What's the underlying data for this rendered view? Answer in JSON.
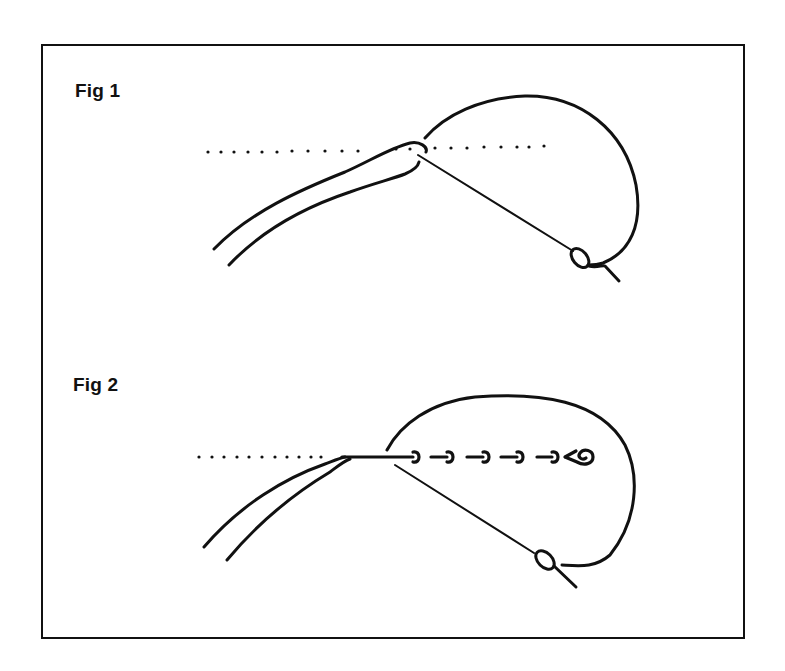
{
  "figures": [
    {
      "label": "Fig 1",
      "description": "Needle entering fabric along dotted guideline, thread loop wrapping around to needle eye"
    },
    {
      "label": "Fig 2",
      "description": "Completed whipped stitches along the guideline, thread looped back to needle eye"
    }
  ],
  "style": {
    "line_color": "#111111",
    "background": "#ffffff",
    "frame_color": "#111111"
  }
}
